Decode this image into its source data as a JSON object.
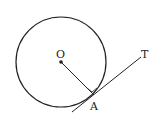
{
  "diagram": {
    "labels": {
      "center": "O",
      "point": "A",
      "tangent": "T"
    },
    "colors": {
      "stroke": "#222222",
      "background": "#ffffff"
    }
  }
}
